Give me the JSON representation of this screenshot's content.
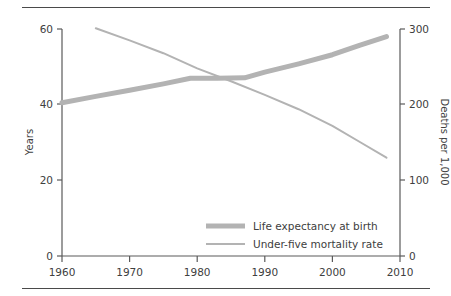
{
  "figure": {
    "background_color": "#ffffff",
    "line_color": "#b3b3b3",
    "axis_color": "#5a5a5a",
    "text_color": "#404040",
    "rule_top": true,
    "rule_bottom": true
  },
  "chart_data": {
    "type": "line",
    "title": "",
    "xlabel": "",
    "ylabel": "Years",
    "y2label": "Deaths per 1,000",
    "xlim": [
      1960,
      2010
    ],
    "ylim": [
      0,
      60
    ],
    "y2lim": [
      0,
      300
    ],
    "xticks": [
      1960,
      1970,
      1980,
      1990,
      2000,
      2010
    ],
    "xticklabels": [
      "1960",
      "1970",
      "1980",
      "1990",
      "2000",
      "2010"
    ],
    "yticks": [
      0,
      20,
      40,
      60
    ],
    "yticklabels": [
      "0",
      "20",
      "40",
      "60"
    ],
    "y2ticks": [
      0,
      100,
      200,
      300
    ],
    "y2ticklabels": [
      "0",
      "100",
      "200",
      "300"
    ],
    "grid": false,
    "legend_position": "lower center",
    "series": [
      {
        "name": "Life expectancy at birth",
        "axis": "left",
        "units": "years",
        "color": "#b3b3b3",
        "linewidth": 5,
        "x": [
          1960,
          1965,
          1970,
          1975,
          1979,
          1983,
          1987,
          1990,
          1995,
          2000,
          2004,
          2008
        ],
        "values": [
          40.5,
          42.2,
          43.8,
          45.5,
          47.0,
          47.0,
          47.1,
          48.6,
          50.8,
          53.2,
          55.7,
          58.0
        ]
      },
      {
        "name": "Under-five mortality rate",
        "axis": "right",
        "units": "deaths per 1,000",
        "color": "#b3b3b3",
        "linewidth": 2,
        "x": [
          1965,
          1970,
          1975,
          1980,
          1985,
          1990,
          1995,
          2000,
          2004,
          2008
        ],
        "values": [
          301,
          285,
          268,
          248,
          231,
          213,
          194,
          172,
          151,
          130
        ]
      }
    ]
  },
  "legend": {
    "items": [
      {
        "label": "Life expectancy at birth",
        "swatch": "thick-line"
      },
      {
        "label": "Under-five mortality rate",
        "swatch": "thin-line"
      }
    ]
  }
}
